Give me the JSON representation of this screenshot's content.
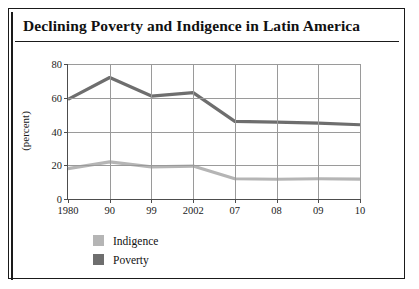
{
  "figure": {
    "title": "Declining Poverty and Indigence in Latin America"
  },
  "chart_data": {
    "type": "line",
    "title": "Declining Poverty and Indigence in Latin America",
    "xlabel": "",
    "ylabel": "(percent)",
    "categories": [
      "1980",
      "90",
      "99",
      "2002",
      "07",
      "08",
      "09",
      "10"
    ],
    "series": [
      {
        "name": "Indigence",
        "color": "#b5b5b5",
        "values": [
          18,
          22,
          19,
          19.5,
          12,
          11.7,
          12,
          11.8
        ]
      },
      {
        "name": "Poverty",
        "color": "#6e6e6e",
        "values": [
          59,
          72,
          61,
          63,
          46,
          45.5,
          45,
          44
        ]
      }
    ],
    "ylim": [
      0,
      80
    ],
    "yticks": [
      0,
      20,
      40,
      60,
      80
    ],
    "ytick_labels": [
      "0",
      "20",
      "40",
      "60",
      "80"
    ],
    "grid": "both",
    "legend_position": "below-left"
  },
  "legend": {
    "items": [
      {
        "label": "Indigence",
        "color": "#b5b5b5"
      },
      {
        "label": "Poverty",
        "color": "#6e6e6e"
      }
    ]
  }
}
